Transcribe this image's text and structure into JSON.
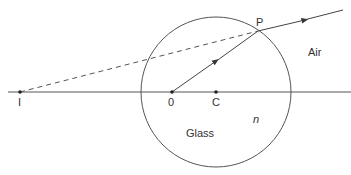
{
  "diagram": {
    "type": "optics-refraction",
    "colors": {
      "line": "#555555",
      "text": "#333333",
      "background": "#ffffff"
    },
    "axis": {
      "y": 92,
      "x_start": 8,
      "x_end": 351
    },
    "sphere": {
      "cx": 216,
      "cy": 92,
      "r": 75
    },
    "points": {
      "I": {
        "label": "I",
        "x": 20,
        "y": 92
      },
      "O": {
        "label": "0",
        "x": 172,
        "y": 92
      },
      "C": {
        "label": "C",
        "x": 216,
        "y": 92
      },
      "P": {
        "label": "P",
        "x": 258,
        "y": 31
      }
    },
    "rays": {
      "internal": {
        "from": "O",
        "to": "P",
        "arrow": true
      },
      "refracted": {
        "from": "P",
        "to_x": 343,
        "to_y": 10,
        "arrow": true
      },
      "virtual": {
        "from": "I",
        "to": "P",
        "dashed": true
      }
    },
    "labels": {
      "air": "Air",
      "glass": "Glass",
      "refractive_index": "n",
      "point_i": "I",
      "point_o": "0",
      "point_c": "C",
      "point_p": "P"
    }
  }
}
